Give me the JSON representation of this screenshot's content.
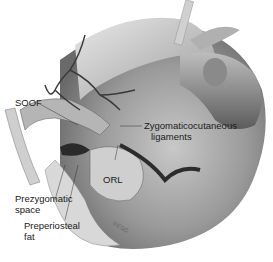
{
  "illustration": {
    "subject": "Midface anatomy, lower eyelid / malar region dissection",
    "labels": {
      "soof": "SOOF",
      "zygomaticocutaneous_line1": "Zygomaticocutaneous",
      "zygomaticocutaneous_line2": "ligaments",
      "orl": "ORL",
      "prezygomatic_line1": "Prezygomatic",
      "prezygomatic_line2": "space",
      "preperiosteal_line1": "Preperiosteal",
      "preperiosteal_line2": "fat"
    },
    "signature": "©ESG",
    "colors": {
      "background": "#ffffff",
      "skin_light": "#d9d9d9",
      "skin_mid": "#a8a8a8",
      "skin_dark": "#5a5a5a",
      "vessel": "#3a3a3a",
      "label_text": "#1a1a1a"
    }
  }
}
